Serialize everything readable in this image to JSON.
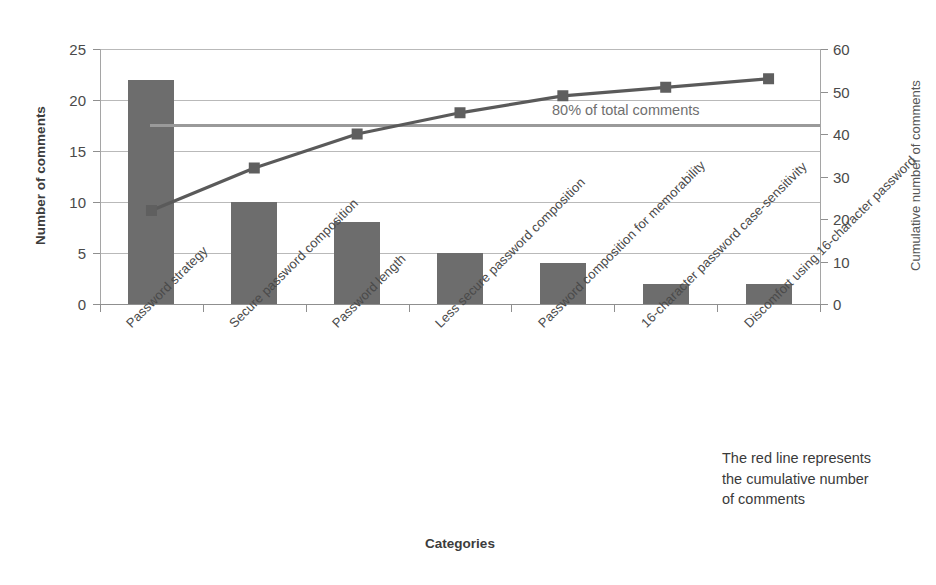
{
  "chart_data": {
    "type": "bar",
    "title": "",
    "xlabel": "Categories",
    "ylabel": "Number of comments",
    "y2label": "Cumulative number of comments",
    "ylim": [
      0,
      25
    ],
    "y2lim": [
      0,
      60
    ],
    "grid": true,
    "legend": "none",
    "categories": [
      "Password strategy",
      "Secure password composition",
      "Password length",
      "Less secure password composition",
      "Password composition for memorability",
      "16-character password case-sensitivity",
      "Discomfort using 16-character password"
    ],
    "series": [
      {
        "name": "Number of comments",
        "type": "bar",
        "axis": "left",
        "values": [
          22,
          10,
          8,
          5,
          4,
          2,
          2
        ]
      },
      {
        "name": "Cumulative number of comments",
        "type": "line",
        "axis": "right",
        "values": [
          22,
          32,
          40,
          45,
          49,
          51,
          53
        ]
      }
    ],
    "reference_line": {
      "label": "80% of total comments",
      "value": 42.4,
      "axis": "right"
    },
    "annotation": {
      "line1": "The red line represents",
      "line2": "the cumulative number",
      "line3": "of comments"
    },
    "yticks_left": [
      "0",
      "5",
      "10",
      "15",
      "20",
      "25"
    ],
    "yticks_right": [
      "0",
      "10",
      "20",
      "30",
      "40",
      "50",
      "60"
    ],
    "colors": {
      "bar": "#6d6d6d",
      "line": "#5a5a5a",
      "marker": "#5f5f5f",
      "reference": "#9a9a9a",
      "grid": "#b9b9b9",
      "text": "#3a3a3a"
    }
  }
}
